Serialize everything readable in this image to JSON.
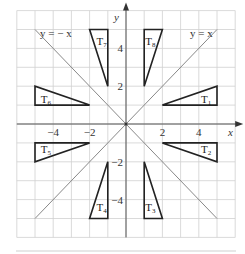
{
  "diagram": {
    "axes": {
      "x_label": "x",
      "y_label": "y",
      "x_ticks": [
        {
          "value": -4,
          "label": "−4"
        },
        {
          "value": -2,
          "label": "−2"
        },
        {
          "value": 2,
          "label": "2"
        },
        {
          "value": 4,
          "label": "4"
        }
      ],
      "y_ticks": [
        {
          "value": 4,
          "label": "4"
        },
        {
          "value": 2,
          "label": "2"
        },
        {
          "value": -2,
          "label": "−2"
        },
        {
          "value": -4,
          "label": "−4"
        }
      ],
      "range": {
        "x": [
          -6,
          6
        ],
        "y": [
          -6,
          6
        ]
      }
    },
    "lines": [
      {
        "name": "y = x",
        "label": "y = x"
      },
      {
        "name": "y = -x",
        "label": "y = − x"
      }
    ],
    "triangles": [
      {
        "label": "T",
        "sub": "1",
        "points": [
          [
            2,
            1
          ],
          [
            5,
            1
          ],
          [
            5,
            2
          ]
        ]
      },
      {
        "label": "T",
        "sub": "2",
        "points": [
          [
            2,
            -1
          ],
          [
            5,
            -1
          ],
          [
            5,
            -2
          ]
        ]
      },
      {
        "label": "T",
        "sub": "3",
        "points": [
          [
            1,
            -2
          ],
          [
            1,
            -5
          ],
          [
            2,
            -5
          ]
        ]
      },
      {
        "label": "T",
        "sub": "4",
        "points": [
          [
            -1,
            -2
          ],
          [
            -1,
            -5
          ],
          [
            -2,
            -5
          ]
        ]
      },
      {
        "label": "T",
        "sub": "5",
        "points": [
          [
            -2,
            -1
          ],
          [
            -5,
            -1
          ],
          [
            -5,
            -2
          ]
        ]
      },
      {
        "label": "T",
        "sub": "6",
        "points": [
          [
            -2,
            1
          ],
          [
            -5,
            1
          ],
          [
            -5,
            2
          ]
        ]
      },
      {
        "label": "T",
        "sub": "7",
        "points": [
          [
            -1,
            2
          ],
          [
            -1,
            5
          ],
          [
            -2,
            5
          ]
        ]
      },
      {
        "label": "T",
        "sub": "8",
        "points": [
          [
            1,
            2
          ],
          [
            1,
            5
          ],
          [
            2,
            5
          ]
        ]
      }
    ],
    "colors": {
      "grid": "#d0d0d0",
      "axis": "#555555",
      "diagonal": "#888888",
      "triangle": "#222222"
    }
  }
}
